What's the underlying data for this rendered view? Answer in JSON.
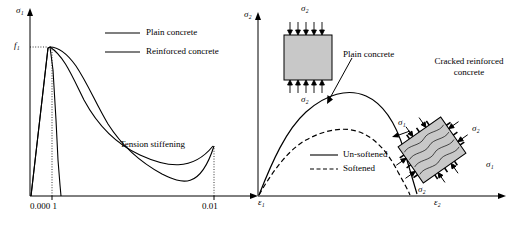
{
  "figure": {
    "left_panel": {
      "y_axis_label": "σ₁",
      "x_axis_label": "ε₁",
      "y_tick_label": "f₁",
      "x_ticks": [
        "0.000 1",
        "0.01"
      ],
      "legend": [
        {
          "label": "Plain concrete",
          "style": "solid"
        },
        {
          "label": "Reinforced concrete",
          "style": "solid"
        }
      ],
      "annotation": "Tension stiffening"
    },
    "right_panel": {
      "y_axis_label": "σ₂",
      "x_axis_label": "ε₂",
      "legend": [
        {
          "label": "Un-softened",
          "style": "solid"
        },
        {
          "label": "Softened",
          "style": "dashed"
        }
      ],
      "callouts": [
        {
          "label": "Plain concrete"
        },
        {
          "label": "Cracked reinforced concrete"
        }
      ],
      "specimen_top": {
        "top_stress": "σ₂",
        "bottom_stress": "σ₂"
      },
      "specimen_bottom": {
        "stress_top_left": "σ₁",
        "stress_top_right": "σ₂",
        "stress_bottom_left": "σ₂",
        "stress_bottom_right": "σ₁"
      }
    }
  },
  "colors": {
    "stroke": "#000000",
    "specimen_fill": "#c8c8c8",
    "specimen_edge": "#000000",
    "background": "#ffffff"
  }
}
